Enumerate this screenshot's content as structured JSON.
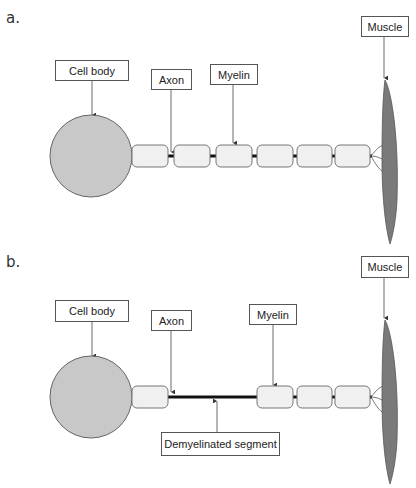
{
  "panels": {
    "a": {
      "letter": "a.",
      "labels": {
        "cell_body": "Cell body",
        "axon": "Axon",
        "myelin": "Myelin",
        "muscle": "Muscle"
      }
    },
    "b": {
      "letter": "b.",
      "labels": {
        "cell_body": "Cell body",
        "axon": "Axon",
        "myelin": "Myelin",
        "muscle": "Muscle",
        "demyelinated": "Demyelinated segment"
      }
    }
  },
  "colors": {
    "cell_body_fill": "#c8c8c8",
    "myelin_fill": "#f0f0f0",
    "muscle_fill": "#7a7a7a",
    "axon_stroke": "#111111",
    "outline": "#555555"
  }
}
